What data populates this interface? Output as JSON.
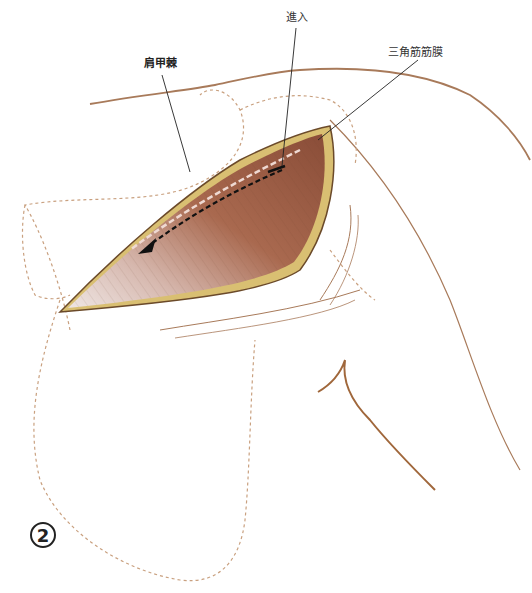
{
  "figure": {
    "number": "2",
    "labels": {
      "scapular_spine": "肩甲棘",
      "approach": "進入",
      "deltoid_fascia": "三角筋筋膜"
    },
    "colors": {
      "skin_line": "#a87a5a",
      "dotted_outline": "#c9a07f",
      "muscle": "#9a5a45",
      "muscle_light": "#e9dcd8",
      "wound_edge": "#d9bf72",
      "arrow": "#111111",
      "leader_line": "#222222"
    }
  }
}
